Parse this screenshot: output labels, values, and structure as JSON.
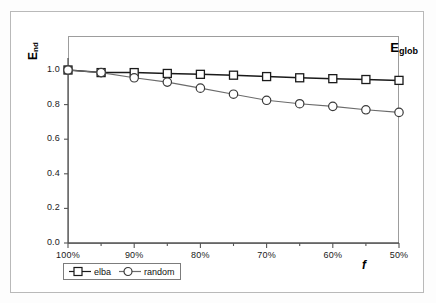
{
  "chart_data": {
    "type": "line",
    "title": "",
    "annotation": "E",
    "annotation_sub": "glob",
    "xlabel": "f",
    "ylabel": "E",
    "ylabel_sub": "nd",
    "x": [
      "100%",
      "95%",
      "90%",
      "85%",
      "80%",
      "75%",
      "70%",
      "65%",
      "60%",
      "55%",
      "50%"
    ],
    "x_ticklabels": [
      "100%",
      "90%",
      "80%",
      "70%",
      "60%",
      "50%"
    ],
    "y_ticklabels": [
      "0.0",
      "0.2",
      "0.4",
      "0.6",
      "0.8",
      "1.0"
    ],
    "xlim": [
      100,
      50
    ],
    "ylim": [
      0.0,
      1.0
    ],
    "grid": false,
    "legend_position": "bottom-left",
    "series": [
      {
        "name": "elba",
        "marker": "square",
        "color": "#1a1a1a",
        "values": [
          1.0,
          0.985,
          0.985,
          0.98,
          0.975,
          0.97,
          0.962,
          0.955,
          0.95,
          0.945,
          0.94
        ]
      },
      {
        "name": "random",
        "marker": "circle",
        "color": "#6b6b6b",
        "values": [
          1.0,
          0.985,
          0.955,
          0.93,
          0.895,
          0.86,
          0.825,
          0.805,
          0.79,
          0.77,
          0.755
        ]
      }
    ]
  },
  "legend": {
    "items": [
      {
        "label": "elba"
      },
      {
        "label": "random"
      }
    ]
  },
  "colors": {
    "series_elba": "#1a1a1a",
    "series_random": "#6b6b6b",
    "panel_border": "#9d9d9d",
    "outer_frame": "#b9b9b9",
    "background": "#ffffff"
  }
}
